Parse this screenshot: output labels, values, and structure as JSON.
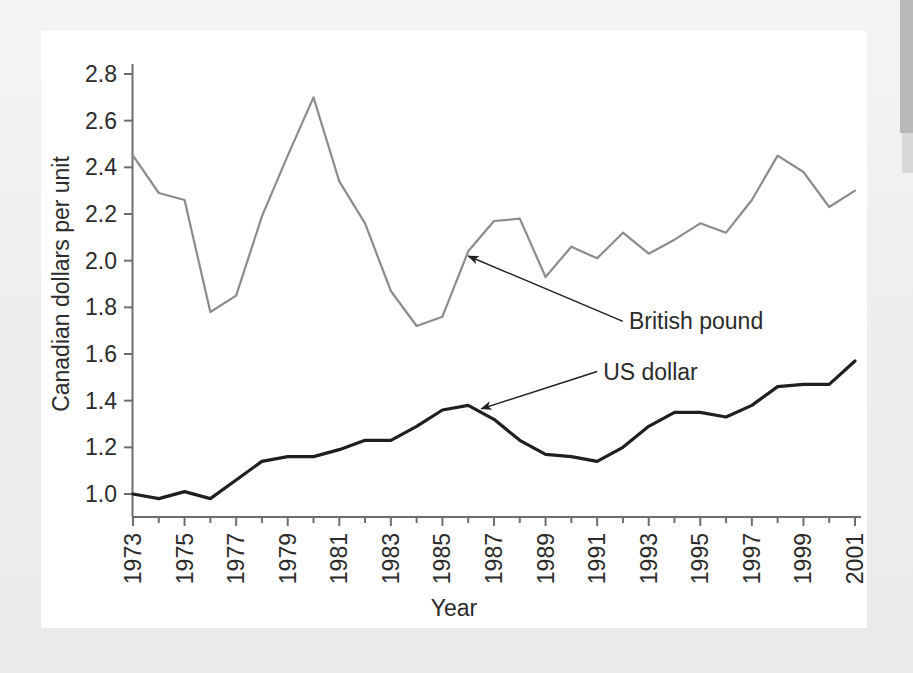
{
  "chart_data": {
    "type": "line",
    "title": "",
    "xlabel": "Year",
    "ylabel": "Canadian dollars per unit",
    "xlim": [
      1973,
      2001
    ],
    "ylim": [
      1.0,
      2.8
    ],
    "ytick_step": 0.2,
    "grid": false,
    "legend_position": "inline-annotations",
    "x": [
      1973,
      1974,
      1975,
      1976,
      1977,
      1978,
      1979,
      1980,
      1981,
      1982,
      1983,
      1984,
      1985,
      1986,
      1987,
      1988,
      1989,
      1990,
      1991,
      1992,
      1993,
      1994,
      1995,
      1996,
      1997,
      1998,
      1999,
      2000,
      2001
    ],
    "x_tick_labels": [
      "1973",
      "1975",
      "1977",
      "1979",
      "1981",
      "1983",
      "1985",
      "1987",
      "1989",
      "1991",
      "1993",
      "1995",
      "1997",
      "1999",
      "2001"
    ],
    "y_tick_labels": [
      "2.8",
      "2.6",
      "2.4",
      "2.2",
      "2.0",
      "1.8",
      "1.6",
      "1.4",
      "1.2",
      "1.0"
    ],
    "series": [
      {
        "name": "British pound",
        "color": "#8c8c8c",
        "values": [
          2.45,
          2.29,
          2.26,
          1.78,
          1.85,
          2.19,
          2.45,
          2.7,
          2.34,
          2.16,
          1.87,
          1.72,
          1.76,
          2.04,
          2.17,
          2.18,
          1.93,
          2.06,
          2.01,
          2.12,
          2.03,
          2.09,
          2.16,
          2.12,
          2.26,
          2.45,
          2.38,
          2.23,
          2.3
        ]
      },
      {
        "name": "US dollar",
        "color": "#1f1f1f",
        "values": [
          1.0,
          0.98,
          1.01,
          0.98,
          1.06,
          1.14,
          1.16,
          1.16,
          1.19,
          1.23,
          1.23,
          1.29,
          1.36,
          1.38,
          1.32,
          1.23,
          1.17,
          1.16,
          1.14,
          1.2,
          1.29,
          1.35,
          1.35,
          1.33,
          1.38,
          1.46,
          1.47,
          1.47,
          1.57
        ]
      }
    ],
    "annotations": [
      {
        "text": "British pound",
        "target_x": 1986,
        "target_y": 2.02,
        "label_x": 1992,
        "label_y": 1.74
      },
      {
        "text": "US dollar",
        "target_x": 1986.5,
        "target_y": 1.365,
        "label_x": 1991,
        "label_y": 1.525
      }
    ]
  },
  "figure": {
    "ylabel": "Canadian dollars per unit",
    "xlabel": "Year"
  }
}
